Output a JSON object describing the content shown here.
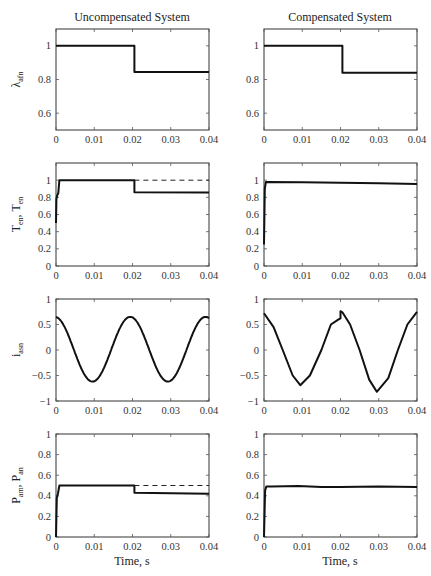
{
  "chart_data": {
    "type": "line",
    "layout": "4 rows x 2 columns grid",
    "column_titles": [
      "Uncompensated System",
      "Compensated System"
    ],
    "shared_xlabel": "Time, s",
    "xlim": [
      0,
      0.04
    ],
    "xticks": [
      0,
      0.01,
      0.02,
      0.03,
      0.04
    ],
    "xtick_labels": [
      "0",
      "0.01",
      "0.02",
      "0.03",
      "0.04"
    ],
    "rows": [
      {
        "ylabel": "λ",
        "ylabel_sub": "afn",
        "ylim": [
          0.5,
          1.1
        ],
        "yticks": [
          0.6,
          0.8,
          1
        ],
        "ytick_labels": [
          "0.6",
          "0.8",
          "1"
        ],
        "panels": [
          {
            "name": "uncompensated-flux",
            "series": [
              {
                "name": "flux",
                "style": "solid",
                "x": [
                  0,
                  0.0205,
                  0.0205,
                  0.04
                ],
                "y": [
                  1.0,
                  1.0,
                  0.845,
                  0.845
                ]
              }
            ]
          },
          {
            "name": "compensated-flux",
            "series": [
              {
                "name": "flux",
                "style": "solid",
                "x": [
                  0,
                  0.0205,
                  0.0205,
                  0.04
                ],
                "y": [
                  1.0,
                  1.0,
                  0.84,
                  0.84
                ]
              }
            ]
          }
        ]
      },
      {
        "ylabel": "T",
        "ylabel_sub": "en",
        "ylabel2": ", T",
        "ylabel2_sub": "en",
        "ylim": [
          0,
          1.2
        ],
        "yticks": [
          0,
          0.2,
          0.4,
          0.6,
          0.8,
          1
        ],
        "ytick_labels": [
          "0",
          "0.2",
          "0.4",
          "0.6",
          "0.8",
          "1"
        ],
        "panels": [
          {
            "name": "uncompensated-torque",
            "series": [
              {
                "name": "torque",
                "style": "solid",
                "x": [
                  0,
                  0.0001,
                  0.0003,
                  0.0006,
                  0.0009,
                  0.0205,
                  0.0205,
                  0.04
                ],
                "y": [
                  0.5,
                  0.78,
                  0.82,
                  0.85,
                  1.0,
                  1.0,
                  0.86,
                  0.855
                ]
              },
              {
                "name": "torque-reference",
                "style": "dashed",
                "x": [
                  0.0205,
                  0.04
                ],
                "y": [
                  1.0,
                  1.0
                ]
              }
            ]
          },
          {
            "name": "compensated-torque",
            "series": [
              {
                "name": "torque",
                "style": "solid",
                "x": [
                  0,
                  0.0002,
                  0.0005,
                  0.01,
                  0.02,
                  0.03,
                  0.04
                ],
                "y": [
                  0.25,
                  0.9,
                  0.98,
                  0.975,
                  0.97,
                  0.965,
                  0.955
                ]
              }
            ]
          }
        ]
      },
      {
        "ylabel": "i",
        "ylabel_sub": "asn",
        "ylim": [
          -1,
          1
        ],
        "yticks": [
          -1,
          -0.5,
          0,
          0.5,
          1
        ],
        "ytick_labels": [
          "−1",
          "−0.5",
          "0",
          "0.5",
          "1"
        ],
        "panels": [
          {
            "name": "uncompensated-current",
            "series": [
              {
                "name": "current",
                "style": "solid",
                "function": "cosine",
                "x": [
                  0,
                  0.0025,
                  0.005,
                  0.0075,
                  0.0098,
                  0.0125,
                  0.015,
                  0.0175,
                  0.0197,
                  0.0225,
                  0.025,
                  0.0275,
                  0.0295,
                  0.0325,
                  0.035,
                  0.0375,
                  0.0395,
                  0.04
                ],
                "y": [
                  0.65,
                  0.42,
                  0.0,
                  -0.43,
                  -0.62,
                  -0.44,
                  0.0,
                  0.45,
                  0.65,
                  0.43,
                  0.0,
                  -0.44,
                  -0.62,
                  -0.43,
                  0.0,
                  0.45,
                  0.65,
                  0.65
                ]
              }
            ]
          },
          {
            "name": "compensated-current",
            "series": [
              {
                "name": "current",
                "style": "solid",
                "x": [
                  0,
                  0.0025,
                  0.005,
                  0.0075,
                  0.0095,
                  0.012,
                  0.015,
                  0.0175,
                  0.0195,
                  0.02,
                  0.02,
                  0.0205,
                  0.0225,
                  0.025,
                  0.0275,
                  0.0295,
                  0.0325,
                  0.035,
                  0.0375,
                  0.04
                ],
                "y": [
                  0.72,
                  0.45,
                  -0.02,
                  -0.5,
                  -0.69,
                  -0.5,
                  0.0,
                  0.5,
                  0.6,
                  0.62,
                  0.76,
                  0.74,
                  0.5,
                  0.0,
                  -0.58,
                  -0.82,
                  -0.55,
                  0.0,
                  0.5,
                  0.75
                ]
              }
            ]
          }
        ]
      },
      {
        "ylabel": "P",
        "ylabel_sub": "am",
        "ylabel2": ", P",
        "ylabel2_sub": "an",
        "ylim": [
          0,
          1
        ],
        "yticks": [
          0,
          0.2,
          0.4,
          0.6,
          0.8,
          1
        ],
        "ytick_labels": [
          "0",
          "0.2",
          "0.4",
          "0.6",
          "0.8",
          "1"
        ],
        "panels": [
          {
            "name": "uncompensated-power",
            "series": [
              {
                "name": "power",
                "style": "solid",
                "x": [
                  0,
                  0.0002,
                  0.0005,
                  0.0009,
                  0.0205,
                  0.0205,
                  0.04
                ],
                "y": [
                  0.0,
                  0.38,
                  0.42,
                  0.5,
                  0.5,
                  0.43,
                  0.42
                ]
              },
              {
                "name": "power-reference",
                "style": "dashed",
                "x": [
                  0.0205,
                  0.04
                ],
                "y": [
                  0.5,
                  0.5
                ]
              }
            ]
          },
          {
            "name": "compensated-power",
            "series": [
              {
                "name": "power",
                "style": "solid",
                "x": [
                  0,
                  0.0003,
                  0.0006,
                  0.002,
                  0.009,
                  0.015,
                  0.02,
                  0.03,
                  0.04
                ],
                "y": [
                  0.0,
                  0.45,
                  0.49,
                  0.49,
                  0.495,
                  0.485,
                  0.485,
                  0.49,
                  0.485
                ]
              }
            ]
          }
        ]
      }
    ]
  }
}
